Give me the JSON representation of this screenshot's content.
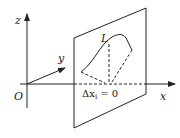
{
  "diagram": {
    "labels": {
      "z_axis": "z",
      "y_axis": "y",
      "x_axis": "x",
      "origin": "O",
      "curve": "L",
      "equation": "Δx_i = 0"
    },
    "equation_parts": {
      "delta": "Δx",
      "sub": "i",
      "rest": " = 0"
    },
    "colors": {
      "stroke": "#222222",
      "background": "#ffffff"
    }
  }
}
